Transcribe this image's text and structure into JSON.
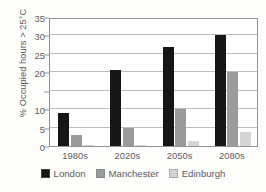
{
  "chart_data": {
    "type": "bar",
    "title": "",
    "xlabel": "",
    "ylabel": "% Occupied hours > 25°C",
    "ylim": [
      0,
      35
    ],
    "grid": true,
    "legend_position": "bottom",
    "categories": [
      "1980s",
      "2020s",
      "2050s",
      "2080s"
    ],
    "yticks": [
      0,
      5,
      10,
      15,
      20,
      25,
      30,
      35
    ],
    "ytick_labels": [
      "0",
      "5",
      "10",
      "",
      "20",
      "25",
      "30",
      "35"
    ],
    "series": [
      {
        "name": "London",
        "color": "#171614",
        "values": [
          9,
          20.5,
          27,
          30
        ]
      },
      {
        "name": "Manchester",
        "color": "#9a9b9d",
        "values": [
          3,
          5,
          10,
          20
        ]
      },
      {
        "name": "Edinburgh",
        "color": "#d2d4d6",
        "values": [
          0.3,
          0.4,
          1.3,
          3.7
        ]
      }
    ]
  },
  "legend": {
    "items": [
      {
        "label": "London"
      },
      {
        "label": "Manchester"
      },
      {
        "label": "Edinburgh"
      }
    ]
  }
}
